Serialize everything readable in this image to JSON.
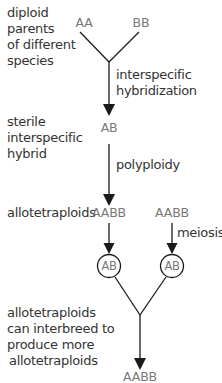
{
  "diagram": {
    "stage_labels": {
      "parents": [
        "diploid",
        "parents",
        "of different",
        "species"
      ],
      "hybrid": [
        "sterile",
        "interspecific",
        "hybrid"
      ],
      "allotetraploids": "allotetraploids",
      "interbreed": [
        "allotetraploids",
        "can interbreed to",
        "produce more",
        "allotetraploids"
      ]
    },
    "genotypes": {
      "parent_a": "AA",
      "parent_b": "BB",
      "hybrid": "AB",
      "tetraploid_left": "AABB",
      "tetraploid_right": "AABB",
      "gamete_left": "AB",
      "gamete_right": "AB",
      "offspring": "AABB"
    },
    "processes": {
      "hybridization": [
        "interspecific",
        "hybridization"
      ],
      "polyploidy": "polyploidy",
      "meiosis": "meiosis"
    },
    "colors": {
      "line": "#1a1a1a",
      "label_text": "#333333",
      "genotype_text": "#777777"
    }
  }
}
